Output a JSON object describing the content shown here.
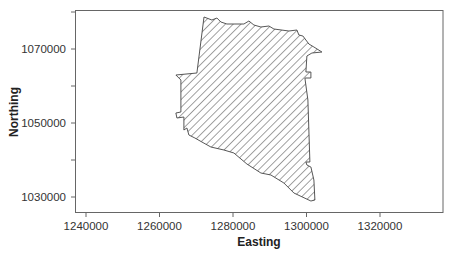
{
  "chart_data": {
    "type": "map-polygon",
    "title": "",
    "xlabel": "Easting",
    "ylabel": "Northing",
    "xlim": [
      1237000,
      1337200
    ],
    "ylim": [
      1026000,
      1080600
    ],
    "x_ticks": [
      1240000,
      1260000,
      1280000,
      1300000,
      1320000
    ],
    "x_tick_labels": [
      "1240000",
      "1260000",
      "1280000",
      "1300000",
      "1320000"
    ],
    "y_ticks_major": [
      1030000,
      1050000,
      1070000
    ],
    "y_tick_labels": [
      "1030000",
      "1050000",
      "1070000"
    ],
    "y_ticks_minor": [
      1040000,
      1060000,
      1080000
    ],
    "grid": false,
    "legend": null,
    "fill": "diagonal-hatch",
    "polygon": {
      "name": "study-area-boundary",
      "vertices_easting_northing": [
        [
          1272100,
          1078650
        ],
        [
          1274250,
          1077840
        ],
        [
          1275610,
          1078380
        ],
        [
          1276700,
          1077300
        ],
        [
          1278330,
          1076760
        ],
        [
          1282960,
          1076760
        ],
        [
          1284320,
          1077570
        ],
        [
          1285680,
          1076490
        ],
        [
          1287590,
          1075950
        ],
        [
          1289760,
          1076220
        ],
        [
          1291120,
          1075410
        ],
        [
          1295200,
          1074860
        ],
        [
          1297380,
          1075140
        ],
        [
          1297930,
          1073780
        ],
        [
          1299020,
          1073510
        ],
        [
          1300650,
          1071350
        ],
        [
          1302010,
          1070540
        ],
        [
          1304190,
          1069190
        ],
        [
          1301470,
          1068920
        ],
        [
          1300110,
          1068110
        ],
        [
          1299840,
          1063780
        ],
        [
          1301200,
          1063780
        ],
        [
          1301200,
          1062160
        ],
        [
          1299560,
          1062160
        ],
        [
          1300380,
          1056220
        ],
        [
          1300920,
          1039460
        ],
        [
          1299840,
          1039460
        ],
        [
          1300110,
          1038650
        ],
        [
          1301200,
          1038110
        ],
        [
          1302010,
          1034590
        ],
        [
          1302290,
          1029190
        ],
        [
          1301200,
          1028920
        ],
        [
          1296570,
          1031080
        ],
        [
          1293850,
          1033780
        ],
        [
          1290310,
          1035950
        ],
        [
          1287590,
          1036490
        ],
        [
          1283780,
          1038920
        ],
        [
          1280250,
          1041890
        ],
        [
          1277520,
          1042700
        ],
        [
          1273990,
          1043510
        ],
        [
          1271540,
          1044860
        ],
        [
          1269630,
          1045950
        ],
        [
          1268000,
          1046760
        ],
        [
          1267460,
          1048650
        ],
        [
          1266640,
          1048110
        ],
        [
          1266640,
          1051620
        ],
        [
          1264730,
          1051350
        ],
        [
          1264460,
          1052700
        ],
        [
          1265820,
          1052970
        ],
        [
          1265820,
          1061620
        ],
        [
          1264460,
          1062970
        ],
        [
          1270180,
          1063510
        ],
        [
          1272100,
          1078650
        ]
      ]
    }
  },
  "axes": {
    "x_title": "Easting",
    "y_title": "Northing",
    "x_labels": [
      "1240000",
      "1260000",
      "1280000",
      "1300000",
      "1320000"
    ],
    "y_labels": [
      "1070000",
      "1050000",
      "1030000"
    ]
  }
}
